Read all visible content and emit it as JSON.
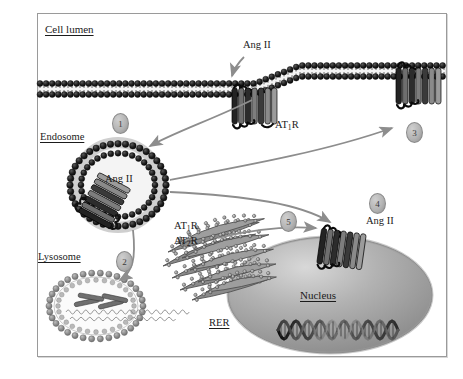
{
  "figure": {
    "width": 463,
    "height": 379,
    "background": "#ffffff",
    "border_color": "#9a9a9a"
  },
  "labels": {
    "cell_lumen": "Cell lumen",
    "endosome": "Endosome",
    "lysosome": "Lysosome",
    "rer": "RER",
    "nucleus": "Nucleus",
    "ang_ii_extracellular": "Ang II",
    "ang_ii_endosome": "Ang II",
    "ang_ii_nuclear": "Ang II",
    "at1r_membrane": "AT",
    "at1r_membrane_sub": "1",
    "at1r_membrane_tail": "R",
    "at1r_rer": "AT",
    "at1r_rer_sub": "1",
    "at1r_rer_tail": "R",
    "at2r_rer": "AT",
    "at2r_rer_sub": "2",
    "at2r_rer_tail": "R"
  },
  "steps": [
    {
      "id": "1",
      "label": "1",
      "meaning": "receptor internalization into endosome"
    },
    {
      "id": "2",
      "label": "2",
      "meaning": "trafficking to lysosome for degradation"
    },
    {
      "id": "3",
      "label": "3",
      "meaning": "recycling back to plasma membrane"
    },
    {
      "id": "4",
      "label": "4",
      "meaning": "trafficking to nuclear membrane"
    },
    {
      "id": "5",
      "label": "5",
      "meaning": "de novo receptor synthesis from RER"
    }
  ],
  "organelles": [
    {
      "name": "plasma-membrane",
      "type": "lipid-bilayer"
    },
    {
      "name": "endosome",
      "type": "vesicle",
      "contents": "Ang II"
    },
    {
      "name": "lysosome",
      "type": "vesicle",
      "contents": "degraded receptor fragments"
    },
    {
      "name": "rer",
      "type": "rough-endoplasmic-reticulum"
    },
    {
      "name": "nucleus",
      "type": "nucleus",
      "contents": "DNA double helix"
    }
  ],
  "colors": {
    "membrane_head": "#1c1c1c",
    "membrane_tail": "#f2f2f2",
    "receptor_dark": "#2b2b2b",
    "receptor_mid": "#808080",
    "nucleus_fill": "#a9a9a9",
    "arrow": "#8d8d8d",
    "text": "#1b1b1b"
  }
}
